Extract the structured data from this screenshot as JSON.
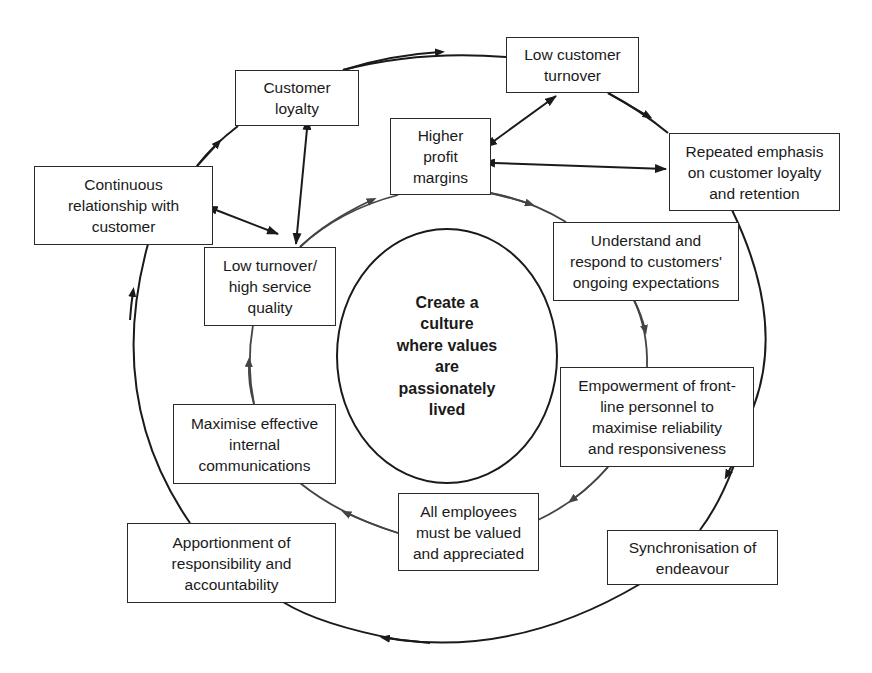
{
  "diagram": {
    "center": {
      "label": "Create a\nculture\nwhere values\nare\npassionately\nlived"
    },
    "outer_ring": [
      {
        "id": "continuous",
        "label": "Continuous\nrelationship with\ncustomer"
      },
      {
        "id": "customer_loyalty",
        "label": "Customer\nloyalty"
      },
      {
        "id": "low_customer_turnover",
        "label": "Low customer\nturnover"
      },
      {
        "id": "repeated_emphasis",
        "label": "Repeated emphasis\non customer loyalty\nand retention"
      },
      {
        "id": "synchronisation",
        "label": "Synchronisation of\nendeavour"
      },
      {
        "id": "apportionment",
        "label": "Apportionment of\nresponsibility and\naccountability"
      }
    ],
    "inner_ring": [
      {
        "id": "low_turnover_service",
        "label": "Low turnover/\nhigh service\nquality"
      },
      {
        "id": "higher_profit",
        "label": "Higher\nprofit\nmargins"
      },
      {
        "id": "understand_respond",
        "label": "Understand and\nrespond to customers'\nongoing expectations"
      },
      {
        "id": "empowerment",
        "label": "Empowerment of front-\nline personnel to\nmaximise reliability\nand responsiveness"
      },
      {
        "id": "all_employees",
        "label": "All employees\nmust be valued\nand appreciated"
      },
      {
        "id": "maximise_comms",
        "label": "Maximise effective\ninternal\ncommunications"
      }
    ],
    "bidirectional_links": [
      [
        "continuous",
        "low_turnover_service"
      ],
      [
        "customer_loyalty",
        "low_turnover_service"
      ],
      [
        "higher_profit",
        "low_customer_turnover"
      ],
      [
        "higher_profit",
        "repeated_emphasis"
      ]
    ],
    "flow_direction": "clockwise",
    "colors": {
      "line": "#1a1a1a",
      "inner_line": "#444444",
      "box_border": "#2a2a2a",
      "background": "#ffffff"
    }
  }
}
